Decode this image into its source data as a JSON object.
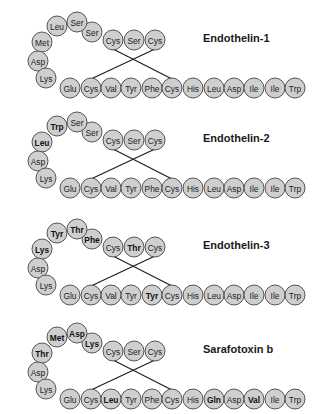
{
  "figure": {
    "colors": {
      "background": "#ffffff",
      "residue_fill": "#cfcfcf",
      "residue_stroke": "#555555",
      "bond": "#222222",
      "text": "#222222"
    },
    "peptides": [
      {
        "name": "Endothelin-1",
        "y_offset": 0,
        "residues": [
          {
            "pos": 1,
            "aa": "Cys",
            "bold": false
          },
          {
            "pos": 2,
            "aa": "Ser",
            "bold": false
          },
          {
            "pos": 3,
            "aa": "Cys",
            "bold": false
          },
          {
            "pos": 4,
            "aa": "Ser",
            "bold": false
          },
          {
            "pos": 5,
            "aa": "Ser",
            "bold": false
          },
          {
            "pos": 6,
            "aa": "Leu",
            "bold": false
          },
          {
            "pos": 7,
            "aa": "Met",
            "bold": false
          },
          {
            "pos": 8,
            "aa": "Asp",
            "bold": false
          },
          {
            "pos": 9,
            "aa": "Lys",
            "bold": false
          },
          {
            "pos": 10,
            "aa": "Glu",
            "bold": false
          },
          {
            "pos": 11,
            "aa": "Cys",
            "bold": false
          },
          {
            "pos": 12,
            "aa": "Val",
            "bold": false
          },
          {
            "pos": 13,
            "aa": "Tyr",
            "bold": false
          },
          {
            "pos": 14,
            "aa": "Phe",
            "bold": false
          },
          {
            "pos": 15,
            "aa": "Cys",
            "bold": false
          },
          {
            "pos": 16,
            "aa": "His",
            "bold": false
          },
          {
            "pos": 17,
            "aa": "Leu",
            "bold": false
          },
          {
            "pos": 18,
            "aa": "Asp",
            "bold": false
          },
          {
            "pos": 19,
            "aa": "Ile",
            "bold": false
          },
          {
            "pos": 20,
            "aa": "Ile",
            "bold": false
          },
          {
            "pos": 21,
            "aa": "Trp",
            "bold": false
          }
        ]
      },
      {
        "name": "Endothelin-2",
        "y_offset": 100,
        "residues": [
          {
            "pos": 1,
            "aa": "Cys",
            "bold": false
          },
          {
            "pos": 2,
            "aa": "Ser",
            "bold": false
          },
          {
            "pos": 3,
            "aa": "Cys",
            "bold": false
          },
          {
            "pos": 4,
            "aa": "Ser",
            "bold": false
          },
          {
            "pos": 5,
            "aa": "Ser",
            "bold": false
          },
          {
            "pos": 6,
            "aa": "Trp",
            "bold": true
          },
          {
            "pos": 7,
            "aa": "Leu",
            "bold": true
          },
          {
            "pos": 8,
            "aa": "Asp",
            "bold": false
          },
          {
            "pos": 9,
            "aa": "Lys",
            "bold": false
          },
          {
            "pos": 10,
            "aa": "Glu",
            "bold": false
          },
          {
            "pos": 11,
            "aa": "Cys",
            "bold": false
          },
          {
            "pos": 12,
            "aa": "Val",
            "bold": false
          },
          {
            "pos": 13,
            "aa": "Tyr",
            "bold": false
          },
          {
            "pos": 14,
            "aa": "Phe",
            "bold": false
          },
          {
            "pos": 15,
            "aa": "Cys",
            "bold": false
          },
          {
            "pos": 16,
            "aa": "His",
            "bold": false
          },
          {
            "pos": 17,
            "aa": "Leu",
            "bold": false
          },
          {
            "pos": 18,
            "aa": "Asp",
            "bold": false
          },
          {
            "pos": 19,
            "aa": "Ile",
            "bold": false
          },
          {
            "pos": 20,
            "aa": "Ile",
            "bold": false
          },
          {
            "pos": 21,
            "aa": "Trp",
            "bold": false
          }
        ]
      },
      {
        "name": "Endothelin-3",
        "y_offset": 207,
        "residues": [
          {
            "pos": 1,
            "aa": "Cys",
            "bold": false
          },
          {
            "pos": 2,
            "aa": "Thr",
            "bold": true
          },
          {
            "pos": 3,
            "aa": "Cys",
            "bold": false
          },
          {
            "pos": 4,
            "aa": "Phe",
            "bold": true
          },
          {
            "pos": 5,
            "aa": "Thr",
            "bold": true
          },
          {
            "pos": 6,
            "aa": "Tyr",
            "bold": true
          },
          {
            "pos": 7,
            "aa": "Lys",
            "bold": true
          },
          {
            "pos": 8,
            "aa": "Asp",
            "bold": false
          },
          {
            "pos": 9,
            "aa": "Lys",
            "bold": false
          },
          {
            "pos": 10,
            "aa": "Glu",
            "bold": false
          },
          {
            "pos": 11,
            "aa": "Cys",
            "bold": false
          },
          {
            "pos": 12,
            "aa": "Val",
            "bold": false
          },
          {
            "pos": 13,
            "aa": "Tyr",
            "bold": false
          },
          {
            "pos": 14,
            "aa": "Tyr",
            "bold": true
          },
          {
            "pos": 15,
            "aa": "Cys",
            "bold": false
          },
          {
            "pos": 16,
            "aa": "His",
            "bold": false
          },
          {
            "pos": 17,
            "aa": "Leu",
            "bold": false
          },
          {
            "pos": 18,
            "aa": "Asp",
            "bold": false
          },
          {
            "pos": 19,
            "aa": "Ile",
            "bold": false
          },
          {
            "pos": 20,
            "aa": "Ile",
            "bold": false
          },
          {
            "pos": 21,
            "aa": "Trp",
            "bold": false
          }
        ]
      },
      {
        "name": "Sarafotoxin b",
        "y_offset": 311,
        "residues": [
          {
            "pos": 1,
            "aa": "Cys",
            "bold": false
          },
          {
            "pos": 2,
            "aa": "Ser",
            "bold": false
          },
          {
            "pos": 3,
            "aa": "Cys",
            "bold": false
          },
          {
            "pos": 4,
            "aa": "Lys",
            "bold": true
          },
          {
            "pos": 5,
            "aa": "Asp",
            "bold": true
          },
          {
            "pos": 6,
            "aa": "Met",
            "bold": true
          },
          {
            "pos": 7,
            "aa": "Thr",
            "bold": true
          },
          {
            "pos": 8,
            "aa": "Asp",
            "bold": false
          },
          {
            "pos": 9,
            "aa": "Lys",
            "bold": false
          },
          {
            "pos": 10,
            "aa": "Glu",
            "bold": false
          },
          {
            "pos": 11,
            "aa": "Cys",
            "bold": false
          },
          {
            "pos": 12,
            "aa": "Leu",
            "bold": true
          },
          {
            "pos": 13,
            "aa": "Tyr",
            "bold": false
          },
          {
            "pos": 14,
            "aa": "Phe",
            "bold": false
          },
          {
            "pos": 15,
            "aa": "Cys",
            "bold": false
          },
          {
            "pos": 16,
            "aa": "His",
            "bold": false
          },
          {
            "pos": 17,
            "aa": "Gln",
            "bold": true
          },
          {
            "pos": 18,
            "aa": "Asp",
            "bold": false
          },
          {
            "pos": 19,
            "aa": "Val",
            "bold": true
          },
          {
            "pos": 20,
            "aa": "Ile",
            "bold": false
          },
          {
            "pos": 21,
            "aa": "Trp",
            "bold": false
          }
        ]
      }
    ],
    "disulfide_bonds": [
      [
        1,
        15
      ],
      [
        3,
        11
      ]
    ]
  }
}
